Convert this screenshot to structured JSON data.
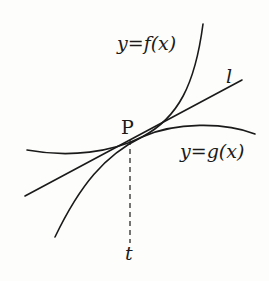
{
  "diagram": {
    "type": "tangent-curves",
    "labels": {
      "f_curve": "y=f(x)",
      "g_curve": "y=g(x)",
      "line": "l",
      "point": "P",
      "x_mark": "t"
    },
    "colors": {
      "stroke": "#1a1a1a",
      "background": "#fdfdfb"
    }
  }
}
